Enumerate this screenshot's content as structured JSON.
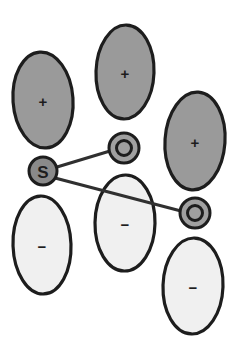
{
  "figure": {
    "background_color": "#ffffff",
    "width": 241,
    "height": 347
  },
  "palette": {
    "positive_lobe_fill": "#9a9a9a",
    "negative_lobe_fill": "#f0f0f0",
    "sulfur_fill": "#8a8a8a",
    "oxygen_fill": "#a0a0a0",
    "outline": "#1d1d1d",
    "bond": "#303030"
  },
  "lobes": [
    {
      "id": "lobe-top-left",
      "sign": "+",
      "phase": "positive",
      "fill": "#9a9a9a",
      "cx": 43,
      "cy": 100,
      "rx": 30,
      "ry": 48,
      "rotate": -4
    },
    {
      "id": "lobe-top-middle",
      "sign": "+",
      "phase": "positive",
      "fill": "#9a9a9a",
      "cx": 125,
      "cy": 72,
      "rx": 29,
      "ry": 47,
      "rotate": 2
    },
    {
      "id": "lobe-top-right",
      "sign": "+",
      "phase": "positive",
      "fill": "#9a9a9a",
      "cx": 195,
      "cy": 141,
      "rx": 30,
      "ry": 49,
      "rotate": 4
    },
    {
      "id": "lobe-bottom-left",
      "sign": "−",
      "phase": "negative",
      "fill": "#f0f0f0",
      "cx": 42,
      "cy": 245,
      "rx": 29,
      "ry": 49,
      "rotate": -2
    },
    {
      "id": "lobe-bottom-middle",
      "sign": "−",
      "phase": "negative",
      "fill": "#f0f0f0",
      "cx": 125,
      "cy": 223,
      "rx": 30,
      "ry": 48,
      "rotate": 1
    },
    {
      "id": "lobe-bottom-right",
      "sign": "−",
      "phase": "negative",
      "fill": "#f0f0f0",
      "cx": 193,
      "cy": 286,
      "rx": 30,
      "ry": 48,
      "rotate": 2
    }
  ],
  "atoms": [
    {
      "id": "atom-sulfur",
      "label": "S",
      "element": "sulfur",
      "fill": "#8a8a8a",
      "cx": 43,
      "cy": 171,
      "r": 14,
      "inner_ring": null
    },
    {
      "id": "atom-oxygen-upper",
      "label": "O",
      "element": "oxygen",
      "fill": "#a0a0a0",
      "cx": 124,
      "cy": 148,
      "r": 15,
      "inner_ring": 7.5
    },
    {
      "id": "atom-oxygen-lower",
      "label": "O",
      "element": "oxygen",
      "fill": "#a0a0a0",
      "cx": 195,
      "cy": 213,
      "r": 15,
      "inner_ring": 7.5
    }
  ],
  "bonds": [
    {
      "id": "bond-s-o-upper",
      "from": "atom-sulfur",
      "to": "atom-oxygen-upper",
      "x1": 57,
      "y1": 167,
      "x2": 110,
      "y2": 151
    },
    {
      "id": "bond-s-o-lower",
      "from": "atom-sulfur",
      "to": "atom-oxygen-lower",
      "x1": 55,
      "y1": 178,
      "x2": 181,
      "y2": 211
    }
  ]
}
